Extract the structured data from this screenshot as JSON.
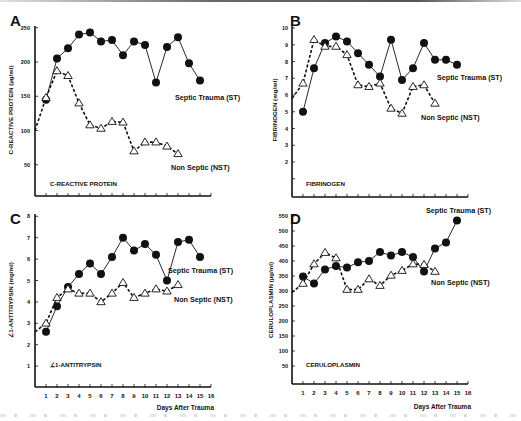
{
  "chart_data": [
    {
      "panel": "A",
      "type": "line",
      "title": "C-REACTIVE PROTEIN",
      "xlabel": "",
      "ylabel": "C-REACTIVE PROTEIN (µg/ml)",
      "yticks": [
        50,
        100,
        150,
        200,
        250
      ],
      "ylim": [
        0,
        250
      ],
      "xlim": [
        0,
        16
      ],
      "series": [
        {
          "name": "Septic Trauma (ST)",
          "marker": "filled-circle",
          "line": "solid",
          "x": [
            1,
            2,
            3,
            4,
            5,
            6,
            7,
            8,
            9,
            10,
            11,
            12,
            13,
            14,
            15
          ],
          "values": [
            145,
            205,
            220,
            240,
            243,
            230,
            232,
            210,
            230,
            225,
            170,
            222,
            236,
            198,
            173
          ]
        },
        {
          "name": "Non Septic (NST)",
          "marker": "open-triangle",
          "line": "dashed",
          "x": [
            0,
            1,
            2,
            3,
            4,
            5,
            6,
            7,
            8,
            9,
            10,
            11,
            12,
            13
          ],
          "values": [
            100,
            148,
            187,
            180,
            140,
            108,
            103,
            113,
            112,
            70,
            83,
            83,
            77,
            66
          ]
        }
      ]
    },
    {
      "panel": "B",
      "type": "line",
      "title": "FIBRINOGEN",
      "xlabel": "",
      "ylabel": "FIBRINOGEN (mg/ml)",
      "yticks": [
        2,
        3,
        4,
        5,
        6,
        7,
        8,
        9,
        10
      ],
      "ylim": [
        0,
        10
      ],
      "xlim": [
        0,
        16
      ],
      "series": [
        {
          "name": "Septic Trauma (ST)",
          "marker": "filled-circle",
          "line": "solid",
          "x": [
            1,
            2,
            3,
            4,
            5,
            6,
            7,
            8,
            9,
            10,
            11,
            12,
            13,
            14,
            15
          ],
          "values": [
            5.0,
            7.6,
            9.1,
            9.5,
            9.2,
            8.5,
            7.8,
            7.1,
            9.3,
            6.9,
            7.6,
            9.1,
            8.1,
            8.1,
            7.8
          ]
        },
        {
          "name": "Non Septic (NST)",
          "marker": "open-triangle",
          "line": "dashed",
          "x": [
            0,
            1,
            2,
            3,
            4,
            5,
            6,
            7,
            8,
            9,
            10,
            11,
            12,
            13
          ],
          "values": [
            5.8,
            6.7,
            9.3,
            8.9,
            8.9,
            8.4,
            6.6,
            6.5,
            6.7,
            5.2,
            4.9,
            6.5,
            6.6,
            5.5
          ]
        }
      ]
    },
    {
      "panel": "C",
      "type": "line",
      "title": "∠1-ANTITRYPSIN",
      "xlabel": "Days After Trauma",
      "ylabel": "∠1-ANTITRYPSIN (mg/ml)",
      "yticks": [
        1,
        2,
        3,
        4,
        5,
        6,
        7,
        8
      ],
      "xticks": [
        1,
        2,
        3,
        4,
        5,
        6,
        7,
        8,
        9,
        10,
        11,
        12,
        13,
        14,
        15,
        16
      ],
      "ylim": [
        0,
        8
      ],
      "xlim": [
        0,
        16
      ],
      "series": [
        {
          "name": "Septic Trauma (ST)",
          "marker": "filled-circle",
          "line": "solid",
          "x": [
            1,
            2,
            3,
            4,
            5,
            6,
            7,
            8,
            9,
            10,
            11,
            12,
            13,
            14,
            15
          ],
          "values": [
            2.6,
            3.8,
            4.7,
            5.3,
            5.8,
            5.3,
            6.1,
            7.0,
            6.4,
            6.7,
            6.2,
            5.0,
            6.8,
            6.9,
            6.1
          ]
        },
        {
          "name": "Non Septic (NST)",
          "marker": "open-triangle",
          "line": "dashed",
          "x": [
            0,
            1,
            2,
            3,
            4,
            5,
            6,
            7,
            8,
            9,
            10,
            11,
            12,
            13
          ],
          "values": [
            2.6,
            3.0,
            4.2,
            4.6,
            4.4,
            4.4,
            4.0,
            4.4,
            4.9,
            4.2,
            4.4,
            4.6,
            4.5,
            4.8
          ]
        }
      ]
    },
    {
      "panel": "D",
      "type": "line",
      "title": "CERULOPLASMIN",
      "xlabel": "Days After Trauma",
      "ylabel": "CERULOPLASMIN (µg/ml)",
      "yticks": [
        50,
        100,
        150,
        200,
        250,
        300,
        350,
        400,
        450,
        500,
        550
      ],
      "xticks": [
        1,
        2,
        3,
        4,
        5,
        6,
        7,
        8,
        9,
        10,
        11,
        12,
        13,
        14,
        15,
        16
      ],
      "ylim": [
        0,
        550
      ],
      "xlim": [
        0,
        16
      ],
      "series": [
        {
          "name": "Septic Trauma (ST)",
          "marker": "filled-circle",
          "line": "solid",
          "x": [
            1,
            2,
            3,
            4,
            5,
            6,
            7,
            8,
            9,
            10,
            11,
            12,
            13,
            14,
            15
          ],
          "values": [
            348,
            325,
            372,
            383,
            378,
            396,
            400,
            430,
            418,
            430,
            413,
            365,
            442,
            462,
            535
          ]
        },
        {
          "name": "Non Septic (NST)",
          "marker": "open-triangle",
          "line": "dashed",
          "x": [
            0,
            1,
            2,
            3,
            4,
            5,
            6,
            7,
            8,
            9,
            10,
            11,
            12,
            13
          ],
          "values": [
            295,
            325,
            390,
            428,
            410,
            305,
            305,
            340,
            318,
            352,
            368,
            390,
            388,
            365
          ]
        }
      ]
    }
  ],
  "panels": {
    "A": {
      "letter": "A",
      "ylabel": "C-REACTIVE PROTEIN (µg/ml)",
      "inner_title": "C-REACTIVE PROTEIN",
      "st_label": "Septic Trauma (ST)",
      "nst_label": "Non Septic (NST)"
    },
    "B": {
      "letter": "B",
      "ylabel": "FIBRINOGEN (mg/ml)",
      "inner_title": "FIBRINOGEN",
      "st_label": "Septic Trauma (ST)",
      "nst_label": "Non Septic (NST)"
    },
    "C": {
      "letter": "C",
      "ylabel": "∠1-ANTITRYPSIN (mg/ml)",
      "inner_title": "∠1-ANTITRYPSIN",
      "st_label": "Septic Trauma (ST)",
      "nst_label": "Non Septic (NST)",
      "xlabel": "Days After Trauma"
    },
    "D": {
      "letter": "D",
      "ylabel": "CERULOPLASMIN (µg/ml)",
      "inner_title": "CERULOPLASMIN",
      "st_label": "Septic Trauma (ST)",
      "nst_label": "Non Septic (NST)",
      "xlabel": "Days After Trauma"
    }
  },
  "layout": {
    "A": {
      "x0": 35,
      "dx": 11,
      "y0": 199,
      "yscale": 0.685,
      "xaxis_y": 196,
      "ytop": 26,
      "lx": 10,
      "ly": 14,
      "inner_x": 50,
      "inner_y": 186,
      "st_x": 175,
      "st_y": 100,
      "nst_x": 171,
      "nst_y": 170,
      "ylabel_x": 13,
      "ylabel_y": 110,
      "ytick_label_x": 30
    },
    "B": {
      "x0": 292,
      "dx": 11,
      "y0": 195.5,
      "yscale": 16.75,
      "xaxis_y": 197,
      "ytop": 26,
      "lx": 290,
      "ly": 14,
      "inner_x": 306,
      "inner_y": 186,
      "st_x": 437,
      "st_y": 80,
      "nst_x": 421,
      "nst_y": 120,
      "ylabel_x": 277,
      "ylabel_y": 110,
      "ytick_label_x": 288,
      "extra_tick": 1
    },
    "C": {
      "x0": 35,
      "dx": 11,
      "y0": 387.5,
      "yscale": 21.4,
      "xaxis_y": 387,
      "ytop": 214,
      "lx": 10,
      "ly": 212,
      "inner_x": 50,
      "inner_y": 367,
      "st_x": 168,
      "st_y": 273,
      "nst_x": 174,
      "nst_y": 302,
      "ylabel_x": 13,
      "ylabel_y": 300,
      "ytick_label_x": 30,
      "xtick_label_y": 398,
      "xlabel_x": 214,
      "xlabel_y": 410
    },
    "D": {
      "x0": 292,
      "dx": 11,
      "y0": 381,
      "yscale": 0.3,
      "xaxis_y": 384,
      "ytop": 214,
      "lx": 290,
      "ly": 212,
      "inner_x": 306,
      "inner_y": 367,
      "st_x": 426,
      "st_y": 213,
      "nst_x": 431,
      "nst_y": 285,
      "ylabel_x": 273,
      "ylabel_y": 300,
      "ytick_label_x": 288,
      "xtick_label_y": 395,
      "xlabel_x": 471,
      "xlabel_y": 409
    }
  },
  "colors": {
    "ink": "#111111",
    "background": "#ffffff"
  }
}
